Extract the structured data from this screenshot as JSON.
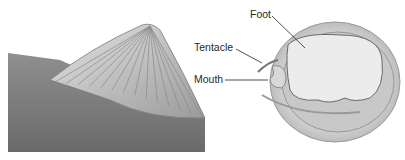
{
  "diagram": {
    "left_figure": "limpet-shell-on-rock",
    "right_figure": "limpet-underside",
    "labels": {
      "foot": "Foot",
      "tentacle": "Tentacle",
      "mouth": "Mouth"
    }
  }
}
